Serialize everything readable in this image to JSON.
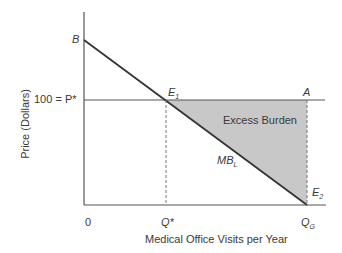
{
  "diagram": {
    "y_axis_label": "Price (Dollars)",
    "x_axis_label": "Medical Office Visits per Year",
    "price_label": "100 = P*",
    "origin_label": "0",
    "q_star_label": "Q*",
    "q_g_label": "Q",
    "q_g_sub": "G",
    "point_b": "B",
    "point_e1": "E",
    "point_e1_sub": "1",
    "point_a": "A",
    "point_e2": "E",
    "point_e2_sub": "2",
    "curve_label": "MB",
    "curve_label_sub": "L",
    "region_label": "Excess Burden",
    "colors": {
      "axis": "#555555",
      "curve": "#333333",
      "shading": "#c8c8c8",
      "dashed": "#777777"
    }
  }
}
